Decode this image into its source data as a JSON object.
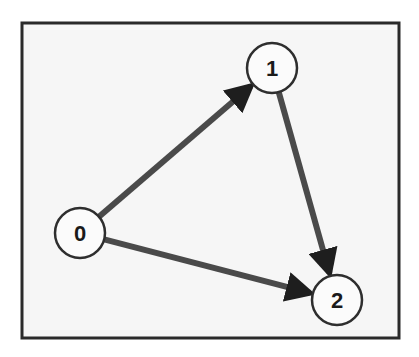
{
  "diagram": {
    "type": "directed-graph",
    "frame": {
      "x": 22,
      "y": 23,
      "width": 377,
      "height": 315
    },
    "colors": {
      "background": "#f6f6f6",
      "border": "#2a2a2a",
      "edge": "#4a4a4a",
      "node_fill": "#fbfbfb",
      "node_stroke": "#2e2e2e"
    },
    "nodes": [
      {
        "id": "0",
        "label": "0",
        "x": 80,
        "y": 233,
        "r": 25
      },
      {
        "id": "1",
        "label": "1",
        "x": 272,
        "y": 68,
        "r": 25
      },
      {
        "id": "2",
        "label": "2",
        "x": 337,
        "y": 300,
        "r": 25
      }
    ],
    "edges": [
      {
        "from": "0",
        "to": "1"
      },
      {
        "from": "1",
        "to": "2"
      },
      {
        "from": "0",
        "to": "2"
      }
    ]
  }
}
